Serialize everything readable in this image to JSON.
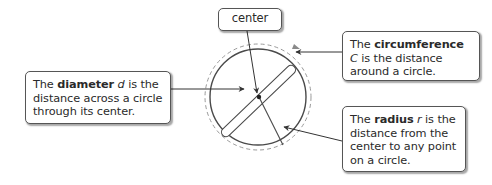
{
  "diagram": {
    "colors": {
      "stroke": "#4a4a4a",
      "dashed": "#9a9a9a",
      "box_border": "#555555",
      "text": "#2a2a2a"
    },
    "callouts": {
      "center": {
        "text": "center"
      },
      "diameter": {
        "prefix": "The ",
        "term": "diameter",
        "variable": "d",
        "suffix": " is the distance across a circle through its center."
      },
      "circumference": {
        "prefix": "The ",
        "term": "circumference",
        "variable": "C",
        "suffix": " is the distance around a circle."
      },
      "radius": {
        "prefix": "The ",
        "term": "radius",
        "variable": "r",
        "suffix": " is the distance from the center to any point on a circle."
      }
    },
    "geometry": {
      "circle_center": [
        258,
        97
      ],
      "circle_radius": 48,
      "dashed_radius": 53,
      "diameter_from": [
        223,
        135
      ],
      "diameter_to": [
        294,
        67
      ],
      "radius_end": [
        283,
        145
      ]
    }
  }
}
